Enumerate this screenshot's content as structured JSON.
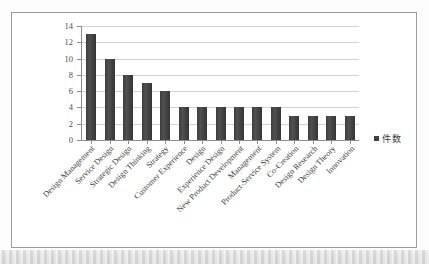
{
  "chart_data": {
    "type": "bar",
    "title": "",
    "xlabel": "",
    "ylabel": "",
    "ylim": [
      0,
      14
    ],
    "ytick_step": 2,
    "yticks": [
      14,
      12,
      10,
      8,
      6,
      4,
      2,
      0
    ],
    "grid": true,
    "legend_position": "right",
    "legend": [
      "件数"
    ],
    "categories": [
      "Design Management",
      "Service Design",
      "Strategic Design",
      "Design Thinking",
      "Strategy",
      "Customer Experience",
      "Design",
      "Experience Design",
      "New Product Development",
      "Management",
      "Product-Service System",
      "Co-Creation",
      "Design Research",
      "Design Theory",
      "Innovation"
    ],
    "values": [
      13,
      10,
      8,
      7,
      6,
      4,
      4,
      4,
      4,
      4,
      4,
      3,
      3,
      3,
      3
    ],
    "series": [
      {
        "name": "件数",
        "values": [
          13,
          10,
          8,
          7,
          6,
          4,
          4,
          4,
          4,
          4,
          4,
          3,
          3,
          3,
          3
        ]
      }
    ]
  },
  "style": {
    "bar_color": "#434343",
    "grid_color": "#d2d2d2",
    "axis_color": "#8d8d8d",
    "frame_color": "#9a9a9a",
    "background": "#ffffff",
    "label_color": "#3f3f3f"
  }
}
